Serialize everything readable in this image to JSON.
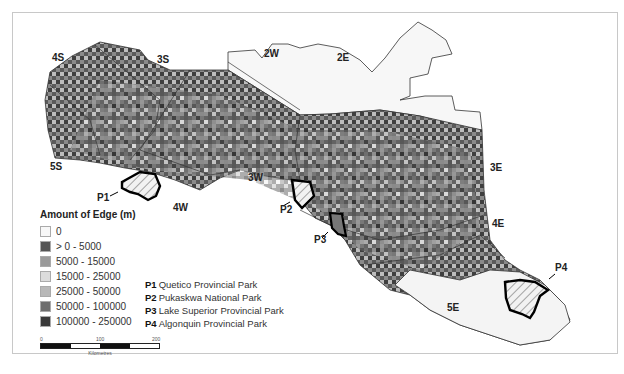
{
  "legend": {
    "title": "Amount of Edge (m)",
    "items": [
      {
        "label": "0",
        "color": "#f7f7f7"
      },
      {
        "label": "> 0 - 5000",
        "color": "#555555"
      },
      {
        "label": "5000 - 15000",
        "color": "#9a9a9a"
      },
      {
        "label": "15000 - 25000",
        "color": "#dcdcdc"
      },
      {
        "label": "25000 - 50000",
        "color": "#b8b8b8"
      },
      {
        "label": "50000 - 100000",
        "color": "#6e6e6e"
      },
      {
        "label": "100000 - 250000",
        "color": "#3a3a3a"
      }
    ]
  },
  "parks": [
    {
      "code": "P1",
      "name": "Quetico Provincial Park"
    },
    {
      "code": "P2",
      "name": "Pukaskwa National Park"
    },
    {
      "code": "P3",
      "name": "Lake Superior Provincial Park"
    },
    {
      "code": "P4",
      "name": "Algonquin Provincial Park"
    }
  ],
  "zones": [
    "4S",
    "3S",
    "2W",
    "2E",
    "5S",
    "3W",
    "4W",
    "3E",
    "4E",
    "5E"
  ],
  "park_labels": [
    "P1",
    "P2",
    "P3",
    "P4"
  ],
  "scalebar": {
    "ticks": [
      "0",
      "100",
      "200"
    ],
    "unit": "Kilometres"
  }
}
